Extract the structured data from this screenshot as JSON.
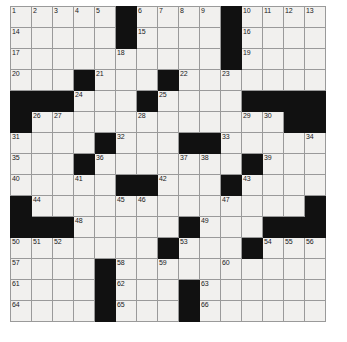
{
  "puzzle": {
    "title": "Crossword Grid",
    "rows": 15,
    "columns": 15,
    "cell_size_px": 21,
    "colors": {
      "block": "#111111",
      "cell": "#f1f0ee",
      "grid_line": "#9a9a9a",
      "number_text": "#1a1a1a",
      "page_background": "#ffffff"
    },
    "clue_number_count": 66,
    "grid": [
      [
        {
          "n": "1",
          "b": false
        },
        {
          "n": "2",
          "b": false
        },
        {
          "n": "3",
          "b": false
        },
        {
          "n": "4",
          "b": false
        },
        {
          "n": "5",
          "b": false
        },
        {
          "n": "",
          "b": true
        },
        {
          "n": "6",
          "b": false
        },
        {
          "n": "7",
          "b": false
        },
        {
          "n": "8",
          "b": false
        },
        {
          "n": "9",
          "b": false
        },
        {
          "n": "",
          "b": true
        },
        {
          "n": "10",
          "b": false
        },
        {
          "n": "11",
          "b": false
        },
        {
          "n": "12",
          "b": false
        },
        {
          "n": "13",
          "b": false
        }
      ],
      [
        {
          "n": "14",
          "b": false
        },
        {
          "n": "",
          "b": false
        },
        {
          "n": "",
          "b": false
        },
        {
          "n": "",
          "b": false
        },
        {
          "n": "",
          "b": false
        },
        {
          "n": "",
          "b": true
        },
        {
          "n": "15",
          "b": false
        },
        {
          "n": "",
          "b": false
        },
        {
          "n": "",
          "b": false
        },
        {
          "n": "",
          "b": false
        },
        {
          "n": "",
          "b": true
        },
        {
          "n": "16",
          "b": false
        },
        {
          "n": "",
          "b": false
        },
        {
          "n": "",
          "b": false
        },
        {
          "n": "",
          "b": false
        }
      ],
      [
        {
          "n": "17",
          "b": false
        },
        {
          "n": "",
          "b": false
        },
        {
          "n": "",
          "b": false
        },
        {
          "n": "",
          "b": false
        },
        {
          "n": "",
          "b": false
        },
        {
          "n": "18",
          "b": false
        },
        {
          "n": "",
          "b": false
        },
        {
          "n": "",
          "b": false
        },
        {
          "n": "",
          "b": false
        },
        {
          "n": "",
          "b": false
        },
        {
          "n": "",
          "b": true
        },
        {
          "n": "19",
          "b": false
        },
        {
          "n": "",
          "b": false
        },
        {
          "n": "",
          "b": false
        },
        {
          "n": "",
          "b": false
        }
      ],
      [
        {
          "n": "20",
          "b": false
        },
        {
          "n": "",
          "b": false
        },
        {
          "n": "",
          "b": false
        },
        {
          "n": "",
          "b": true
        },
        {
          "n": "21",
          "b": false
        },
        {
          "n": "",
          "b": false
        },
        {
          "n": "",
          "b": false
        },
        {
          "n": "",
          "b": true
        },
        {
          "n": "22",
          "b": false
        },
        {
          "n": "",
          "b": false
        },
        {
          "n": "23",
          "b": false
        },
        {
          "n": "",
          "b": false
        },
        {
          "n": "",
          "b": false
        },
        {
          "n": "",
          "b": false
        },
        {
          "n": "",
          "b": false
        }
      ],
      [
        {
          "n": "",
          "b": true
        },
        {
          "n": "",
          "b": true
        },
        {
          "n": "",
          "b": true
        },
        {
          "n": "24",
          "b": false
        },
        {
          "n": "",
          "b": false
        },
        {
          "n": "",
          "b": false
        },
        {
          "n": "",
          "b": true
        },
        {
          "n": "25",
          "b": false
        },
        {
          "n": "",
          "b": false
        },
        {
          "n": "",
          "b": false
        },
        {
          "n": "",
          "b": false
        },
        {
          "n": "",
          "b": true
        },
        {
          "n": "",
          "b": true
        },
        {
          "n": "",
          "b": true
        },
        {
          "n": "",
          "b": true
        }
      ],
      [
        {
          "n": "",
          "b": true
        },
        {
          "n": "26",
          "b": false
        },
        {
          "n": "27",
          "b": false
        },
        {
          "n": "",
          "b": false
        },
        {
          "n": "",
          "b": false
        },
        {
          "n": "",
          "b": false
        },
        {
          "n": "28",
          "b": false
        },
        {
          "n": "",
          "b": false
        },
        {
          "n": "",
          "b": false
        },
        {
          "n": "",
          "b": false
        },
        {
          "n": "",
          "b": false
        },
        {
          "n": "29",
          "b": false
        },
        {
          "n": "30",
          "b": false
        },
        {
          "n": "",
          "b": true
        },
        {
          "n": "",
          "b": true
        }
      ],
      [
        {
          "n": "31",
          "b": false
        },
        {
          "n": "",
          "b": false
        },
        {
          "n": "",
          "b": false
        },
        {
          "n": "",
          "b": false
        },
        {
          "n": "",
          "b": true
        },
        {
          "n": "32",
          "b": false
        },
        {
          "n": "",
          "b": false
        },
        {
          "n": "",
          "b": false
        },
        {
          "n": "",
          "b": true
        },
        {
          "n": "",
          "b": true
        },
        {
          "n": "33",
          "b": false
        },
        {
          "n": "",
          "b": false
        },
        {
          "n": "",
          "b": false
        },
        {
          "n": "",
          "b": false
        },
        {
          "n": "34",
          "b": false
        }
      ],
      [
        {
          "n": "35",
          "b": false
        },
        {
          "n": "",
          "b": false
        },
        {
          "n": "",
          "b": false
        },
        {
          "n": "",
          "b": true
        },
        {
          "n": "36",
          "b": false
        },
        {
          "n": "",
          "b": false
        },
        {
          "n": "",
          "b": false
        },
        {
          "n": "",
          "b": false
        },
        {
          "n": "37",
          "b": false
        },
        {
          "n": "38",
          "b": false
        },
        {
          "n": "",
          "b": false
        },
        {
          "n": "",
          "b": true
        },
        {
          "n": "39",
          "b": false
        },
        {
          "n": "",
          "b": false
        },
        {
          "n": "",
          "b": false
        }
      ],
      [
        {
          "n": "40",
          "b": false
        },
        {
          "n": "",
          "b": false
        },
        {
          "n": "",
          "b": false
        },
        {
          "n": "41",
          "b": false
        },
        {
          "n": "",
          "b": false
        },
        {
          "n": "",
          "b": true
        },
        {
          "n": "",
          "b": true
        },
        {
          "n": "42",
          "b": false
        },
        {
          "n": "",
          "b": false
        },
        {
          "n": "",
          "b": false
        },
        {
          "n": "",
          "b": true
        },
        {
          "n": "43",
          "b": false
        },
        {
          "n": "",
          "b": false
        },
        {
          "n": "",
          "b": false
        },
        {
          "n": "",
          "b": false
        }
      ],
      [
        {
          "n": "",
          "b": true
        },
        {
          "n": "44",
          "b": false
        },
        {
          "n": "",
          "b": false
        },
        {
          "n": "",
          "b": false
        },
        {
          "n": "",
          "b": false
        },
        {
          "n": "45",
          "b": false
        },
        {
          "n": "46",
          "b": false
        },
        {
          "n": "",
          "b": false
        },
        {
          "n": "",
          "b": false
        },
        {
          "n": "",
          "b": false
        },
        {
          "n": "47",
          "b": false
        },
        {
          "n": "",
          "b": false
        },
        {
          "n": "",
          "b": false
        },
        {
          "n": "",
          "b": false
        },
        {
          "n": "",
          "b": true
        }
      ],
      [
        {
          "n": "",
          "b": true
        },
        {
          "n": "",
          "b": true
        },
        {
          "n": "",
          "b": true
        },
        {
          "n": "48",
          "b": false
        },
        {
          "n": "",
          "b": false
        },
        {
          "n": "",
          "b": false
        },
        {
          "n": "",
          "b": false
        },
        {
          "n": "",
          "b": false
        },
        {
          "n": "",
          "b": true
        },
        {
          "n": "49",
          "b": false
        },
        {
          "n": "",
          "b": false
        },
        {
          "n": "",
          "b": false
        },
        {
          "n": "",
          "b": true
        },
        {
          "n": "",
          "b": true
        },
        {
          "n": "",
          "b": true
        }
      ],
      [
        {
          "n": "50",
          "b": false
        },
        {
          "n": "51",
          "b": false
        },
        {
          "n": "52",
          "b": false
        },
        {
          "n": "",
          "b": false
        },
        {
          "n": "",
          "b": false
        },
        {
          "n": "",
          "b": false
        },
        {
          "n": "",
          "b": false
        },
        {
          "n": "",
          "b": true
        },
        {
          "n": "53",
          "b": false
        },
        {
          "n": "",
          "b": false
        },
        {
          "n": "",
          "b": false
        },
        {
          "n": "",
          "b": true
        },
        {
          "n": "54",
          "b": false
        },
        {
          "n": "55",
          "b": false
        },
        {
          "n": "56",
          "b": false
        }
      ],
      [
        {
          "n": "57",
          "b": false
        },
        {
          "n": "",
          "b": false
        },
        {
          "n": "",
          "b": false
        },
        {
          "n": "",
          "b": false
        },
        {
          "n": "",
          "b": true
        },
        {
          "n": "58",
          "b": false
        },
        {
          "n": "",
          "b": false
        },
        {
          "n": "59",
          "b": false
        },
        {
          "n": "",
          "b": false
        },
        {
          "n": "",
          "b": false
        },
        {
          "n": "60",
          "b": false
        },
        {
          "n": "",
          "b": false
        },
        {
          "n": "",
          "b": false
        },
        {
          "n": "",
          "b": false
        },
        {
          "n": "",
          "b": false
        }
      ],
      [
        {
          "n": "61",
          "b": false
        },
        {
          "n": "",
          "b": false
        },
        {
          "n": "",
          "b": false
        },
        {
          "n": "",
          "b": false
        },
        {
          "n": "",
          "b": true
        },
        {
          "n": "62",
          "b": false
        },
        {
          "n": "",
          "b": false
        },
        {
          "n": "",
          "b": false
        },
        {
          "n": "",
          "b": true
        },
        {
          "n": "63",
          "b": false
        },
        {
          "n": "",
          "b": false
        },
        {
          "n": "",
          "b": false
        },
        {
          "n": "",
          "b": false
        },
        {
          "n": "",
          "b": false
        },
        {
          "n": "",
          "b": false
        }
      ],
      [
        {
          "n": "64",
          "b": false
        },
        {
          "n": "",
          "b": false
        },
        {
          "n": "",
          "b": false
        },
        {
          "n": "",
          "b": false
        },
        {
          "n": "",
          "b": true
        },
        {
          "n": "65",
          "b": false
        },
        {
          "n": "",
          "b": false
        },
        {
          "n": "",
          "b": false
        },
        {
          "n": "",
          "b": true
        },
        {
          "n": "66",
          "b": false
        },
        {
          "n": "",
          "b": false
        },
        {
          "n": "",
          "b": false
        },
        {
          "n": "",
          "b": false
        },
        {
          "n": "",
          "b": false
        },
        {
          "n": "",
          "b": false
        }
      ]
    ]
  }
}
